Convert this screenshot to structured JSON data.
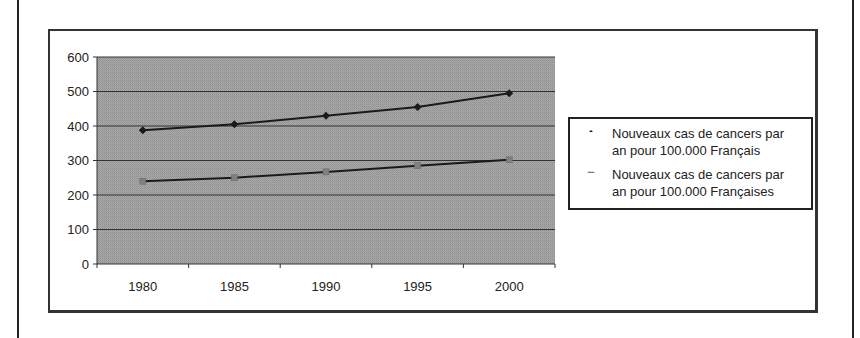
{
  "chart_data": {
    "type": "line",
    "title": "",
    "xlabel": "",
    "ylabel": "",
    "categories": [
      "1980",
      "1985",
      "1990",
      "1995",
      "2000"
    ],
    "ylim": [
      0,
      600
    ],
    "yticks": [
      "0",
      "100",
      "200",
      "300",
      "400",
      "500",
      "600"
    ],
    "grid": true,
    "legend_position": "right",
    "series": [
      {
        "name": "Nouveaux cas de cancers par an pour 100.000 Français",
        "label_line1": "Nouveaux cas de cancers par",
        "label_line2": "an pour 100.000 Français",
        "marker": "diamond",
        "color": "#1a1a1a",
        "values": [
          388,
          405,
          430,
          455,
          495
        ]
      },
      {
        "name": "Nouveaux cas de cancers par an pour 100.000 Françaises",
        "label_line1": "Nouveaux cas de cancers par",
        "label_line2": "an pour 100.000 Françaises",
        "marker": "square",
        "color": "#808080",
        "values": [
          240,
          250,
          267,
          285,
          302
        ]
      }
    ]
  }
}
